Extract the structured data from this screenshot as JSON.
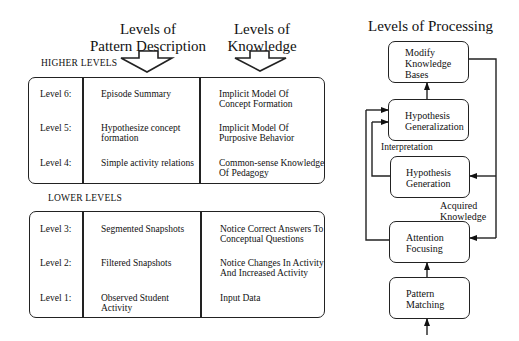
{
  "left_panel": {
    "headers": {
      "pattern_description": "Levels of\nPattern Description",
      "knowledge": "Levels of\nKnowledge"
    },
    "higher_levels": {
      "label": "HIGHER LEVELS",
      "rows": [
        {
          "level": "Level 6:",
          "pattern": "Episode Summary",
          "knowledge": "Implicit Model Of\nConcept Formation"
        },
        {
          "level": "Level 5:",
          "pattern": "Hypothesize concept\nformation",
          "knowledge": "Implicit Model Of\nPurposive Behavior"
        },
        {
          "level": "Level 4:",
          "pattern": "Simple activity relations",
          "knowledge": "Common-sense Knowledge\nOf Pedagogy"
        }
      ]
    },
    "lower_levels": {
      "label": "LOWER LEVELS",
      "rows": [
        {
          "level": "Level 3:",
          "pattern": "Segmented Snapshots",
          "knowledge": "Notice Correct Answers To\nConceptual Questions"
        },
        {
          "level": "Level 2:",
          "pattern": "Filtered Snapshots",
          "knowledge": "Notice Changes In Activity\nAnd Increased Activity"
        },
        {
          "level": "Level 1:",
          "pattern": "Observed Student\nActivity",
          "knowledge": "Input Data"
        }
      ]
    }
  },
  "right_panel": {
    "title": "Levels of Processing",
    "boxes": [
      {
        "id": "modify-knowledge-bases",
        "label": "Modify\nKnowledge\nBases"
      },
      {
        "id": "hypothesis-generalization",
        "label": "Hypothesis\nGeneralization"
      },
      {
        "id": "hypothesis-generation",
        "label": "Hypothesis\nGeneration"
      },
      {
        "id": "attention-focusing",
        "label": "Attention\nFocusing"
      },
      {
        "id": "pattern-matching",
        "label": "Pattern\nMatching"
      }
    ],
    "annotations": {
      "interpretation": "Interpretation",
      "acquired_knowledge": "Acquired\nKnowledge"
    }
  }
}
